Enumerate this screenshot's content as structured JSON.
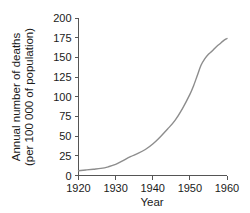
{
  "chart_data": {
    "type": "line",
    "title": "",
    "xlabel": "Year",
    "ylabel": "Annual number of deaths (per 100 000 of population)",
    "ylabel_line1": "Annual number of deaths",
    "ylabel_line2": "(per 100 000 of population)",
    "xlim": [
      1920,
      1960
    ],
    "ylim": [
      0,
      200
    ],
    "grid": false,
    "legend": false,
    "xticks": [
      1920,
      1930,
      1940,
      1950,
      1960
    ],
    "xtick_labels": [
      "1920",
      "1930",
      "1940",
      "1950",
      "1960"
    ],
    "yticks": [
      0,
      25,
      50,
      75,
      100,
      125,
      150,
      175,
      200
    ],
    "ytick_labels": [
      "0",
      "25",
      "50",
      "75",
      "100",
      "125",
      "150",
      "175",
      "200"
    ],
    "series": [
      {
        "name": "Annual number of deaths",
        "color": "#8d8d8d",
        "x": [
          1920,
          1922,
          1924,
          1926,
          1928,
          1930,
          1932,
          1934,
          1936,
          1938,
          1940,
          1942,
          1944,
          1946,
          1948,
          1950,
          1951,
          1952,
          1953,
          1954,
          1955,
          1956,
          1957,
          1958,
          1959,
          1960
        ],
        "y": [
          6,
          7,
          8,
          9,
          11,
          14,
          19,
          24,
          28,
          33,
          40,
          49,
          59,
          70,
          85,
          103,
          114,
          127,
          140,
          148,
          154,
          158,
          163,
          167,
          171,
          174
        ]
      }
    ]
  },
  "axis_titles": {
    "x": "Year",
    "y_line1": "Annual number of deaths",
    "y_line2": "(per 100 000 of population)"
  }
}
